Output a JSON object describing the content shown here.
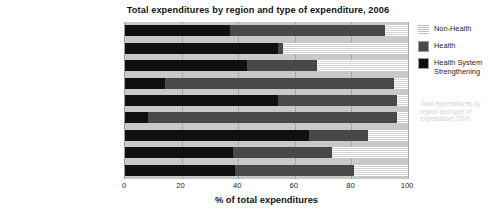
{
  "chart_data": {
    "type": "bar",
    "orientation": "horizontal",
    "stacked": true,
    "title": "Total expenditures by region and type of expenditure, 2006",
    "xlabel": "% of total expenditures",
    "ylabel": "",
    "xlim": [
      0,
      100
    ],
    "xticks": [
      "0",
      "20",
      "40",
      "60",
      "80",
      "100"
    ],
    "xtick_values": [
      0,
      20,
      40,
      60,
      80,
      100
    ],
    "grid": true,
    "legend_position": "right",
    "categories": [
      "Caribbean",
      "East Asia",
      "Eastern Europe & Central Asia",
      "Latin America",
      "MENA",
      "Oceania",
      "South & South East Asia",
      "Sub-Saharan Africa",
      "Western & Central Europe"
    ],
    "series": [
      {
        "name": "Health System Strengthening",
        "color": "#101010",
        "values": [
          37,
          54,
          43,
          14,
          54,
          8,
          65,
          38,
          39
        ]
      },
      {
        "name": "Health",
        "color": "#484848",
        "values": [
          55,
          2,
          25,
          81,
          42,
          88,
          21,
          35,
          42
        ]
      },
      {
        "name": "Non-Health",
        "color": "#ffffff",
        "values": [
          8,
          44,
          32,
          5,
          4,
          4,
          14,
          27,
          19
        ]
      }
    ],
    "legend": [
      {
        "label": "Non-Health",
        "swatch": "hatched-stripes"
      },
      {
        "label": "Health",
        "swatch": "gray-square"
      },
      {
        "label": "Health System Strengthening",
        "swatch": "black-square"
      }
    ],
    "watermark": "Total expenditures by region and type of expenditure 2006",
    "plot_background": "#c9c9c9"
  }
}
